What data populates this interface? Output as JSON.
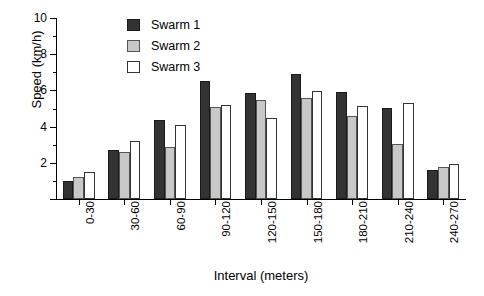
{
  "chart_data": {
    "type": "bar",
    "title": "",
    "xlabel": "Interval (meters)",
    "ylabel": "Speed (km/h)",
    "ylim": [
      0,
      10
    ],
    "ytick_major": [
      0,
      2,
      4,
      6,
      8,
      10
    ],
    "ytick_major_labels": [
      "",
      "2",
      "4",
      "6",
      "8",
      "10"
    ],
    "ytick_minor": [
      1,
      3,
      5,
      7,
      9
    ],
    "grid": false,
    "legend_position": "upper-left-inside",
    "categories": [
      "0-30",
      "30-60",
      "60-90",
      "90-120",
      "120-150",
      "150-180",
      "180-210",
      "210-240",
      "240-270"
    ],
    "series": [
      {
        "name": "Swarm 1",
        "color": "#333333",
        "values": [
          1.0,
          2.7,
          4.35,
          6.5,
          5.85,
          6.9,
          5.9,
          5.05,
          1.6
        ]
      },
      {
        "name": "Swarm 2",
        "color": "#c8c8c8",
        "values": [
          1.2,
          2.6,
          2.9,
          5.1,
          5.45,
          5.6,
          4.6,
          3.05,
          1.75
        ]
      },
      {
        "name": "Swarm 3",
        "color": "#ffffff",
        "values": [
          1.5,
          3.2,
          4.1,
          5.2,
          4.5,
          5.95,
          5.15,
          5.3,
          1.95
        ]
      }
    ]
  },
  "legend": {
    "items": [
      {
        "label": "Swarm 1"
      },
      {
        "label": "Swarm 2"
      },
      {
        "label": "Swarm 3"
      }
    ]
  }
}
